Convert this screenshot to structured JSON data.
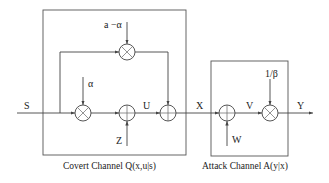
{
  "diagram": {
    "blocks": [
      {
        "id": "covert",
        "label": "Covert Channel Q(x,u|s)"
      },
      {
        "id": "attack",
        "label": "Attack Channel A(y|x)"
      }
    ],
    "signals": {
      "s": "S",
      "u": "U",
      "x": "X",
      "v": "V",
      "y": "Y",
      "z": "Z",
      "w": "W",
      "alpha": "α",
      "a_minus_alpha": "a −α",
      "inv_beta": "1/β"
    },
    "nodes": [
      {
        "id": "mult-alpha",
        "type": "multiplier"
      },
      {
        "id": "mult-a-minus-alpha",
        "type": "multiplier"
      },
      {
        "id": "adder-z",
        "type": "adder"
      },
      {
        "id": "adder-u",
        "type": "adder"
      },
      {
        "id": "adder-w",
        "type": "adder"
      },
      {
        "id": "mult-inv-beta",
        "type": "multiplier"
      }
    ]
  }
}
